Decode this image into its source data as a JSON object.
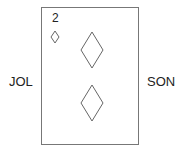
{
  "diagram": {
    "left_label": "JOL",
    "right_label": "SON",
    "card": {
      "rank": "2",
      "suit": "diamond",
      "pips": 2,
      "corner_icon": "small-diamond-icon",
      "pip_icon": "diamond-icon",
      "stroke_color": "#666666"
    }
  }
}
